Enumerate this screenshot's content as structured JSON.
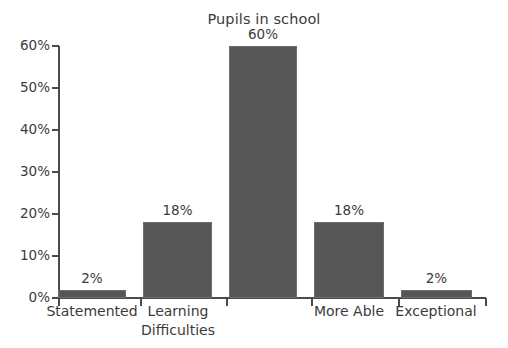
{
  "chart_data": {
    "type": "bar",
    "title": "Pupils in school",
    "xlabel": "",
    "ylabel": "",
    "categories": [
      "Statemented",
      "Learning Difficulties",
      "",
      "More Able",
      "Exceptional"
    ],
    "category_lines": [
      [
        "Statemented"
      ],
      [
        "Learning",
        "Difficulties"
      ],
      [
        ""
      ],
      [
        "More Able"
      ],
      [
        "Exceptional"
      ]
    ],
    "values": [
      2,
      18,
      60,
      18,
      2
    ],
    "value_labels": [
      "2%",
      "18%",
      "60%",
      "18%",
      "2%"
    ],
    "ylim": [
      0,
      60
    ],
    "ytick_values": [
      0,
      10,
      20,
      30,
      40,
      50,
      60
    ],
    "ytick_labels": [
      "0%",
      "10%",
      "20%",
      "30%",
      "40%",
      "50%",
      "60%"
    ],
    "grid": false,
    "legend": false,
    "bar_color": "#565656",
    "axis_color": "#4a4a4a",
    "text_color": "#3b3b3b",
    "background": "#ffffff"
  }
}
